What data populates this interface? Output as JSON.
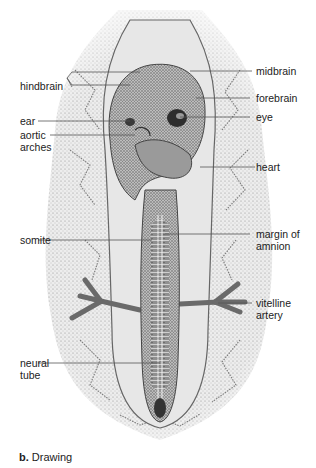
{
  "figure": {
    "caption_prefix": "b.",
    "caption_text": " Drawing",
    "colors": {
      "background": "#ffffff",
      "membrane": "#e6e6e6",
      "stipple": "#6e6e6e",
      "embryo_dark": "#555555",
      "leader_line": "#555555",
      "label_text": "#222222"
    }
  },
  "labels": {
    "left": [
      {
        "id": "hindbrain",
        "text": "hindbrain"
      },
      {
        "id": "ear",
        "text": "ear"
      },
      {
        "id": "aortic_arches_1",
        "text": "aortic"
      },
      {
        "id": "aortic_arches_2",
        "text": "arches"
      },
      {
        "id": "somite",
        "text": "somite"
      },
      {
        "id": "neural_tube_1",
        "text": "neural"
      },
      {
        "id": "neural_tube_2",
        "text": "tube"
      }
    ],
    "right": [
      {
        "id": "midbrain",
        "text": "midbrain"
      },
      {
        "id": "forebrain",
        "text": "forebrain"
      },
      {
        "id": "eye",
        "text": "eye"
      },
      {
        "id": "heart",
        "text": "heart"
      },
      {
        "id": "margin_of_amnion_1",
        "text": "margin of"
      },
      {
        "id": "margin_of_amnion_2",
        "text": "amnion"
      },
      {
        "id": "vitelline_artery_1",
        "text": "vitelline"
      },
      {
        "id": "vitelline_artery_2",
        "text": "artery"
      }
    ]
  }
}
